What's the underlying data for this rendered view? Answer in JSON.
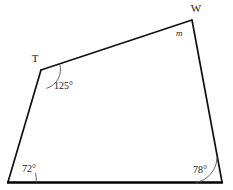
{
  "figure": {
    "shape_name": "quadrilateral",
    "stroke_color": "#111111",
    "base_stroke_color": "#000000",
    "arc_color": "#555555",
    "background_color": "#ffffff",
    "vertices": [
      {
        "id": "bottom-left",
        "label": "",
        "x": 8,
        "y": 182
      },
      {
        "id": "T",
        "label": "T",
        "x": 41,
        "y": 70
      },
      {
        "id": "W",
        "label": "W",
        "x": 192,
        "y": 20
      },
      {
        "id": "bottom-right",
        "label": "",
        "x": 222,
        "y": 182
      }
    ],
    "vertex_labels": {
      "t": "T",
      "w": "W"
    },
    "angles": [
      {
        "at": "bottom-left",
        "text": "72°",
        "has_arc": true,
        "label_x": 22,
        "label_y": 172
      },
      {
        "at": "T",
        "text": "125°",
        "has_arc": true,
        "label_x": 54,
        "label_y": 89
      },
      {
        "at": "W",
        "text": "m",
        "has_arc": false,
        "label_x": 176,
        "label_y": 36
      },
      {
        "at": "bottom-right",
        "text": "78°",
        "has_arc": true,
        "label_x": 193,
        "label_y": 173
      }
    ],
    "angle_values": {
      "bottom_left": "72°",
      "t": "125°",
      "w": "m",
      "bottom_right": "78°"
    }
  }
}
